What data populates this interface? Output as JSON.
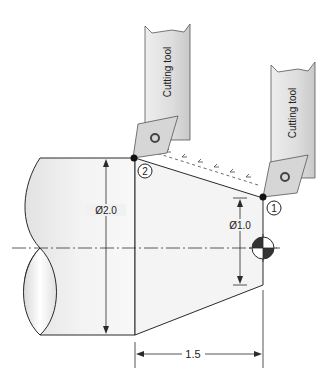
{
  "diagram": {
    "type": "turning-taper-toolpath",
    "tools": [
      {
        "id": "tool-2",
        "label": "Cutting tool"
      },
      {
        "id": "tool-1",
        "label": "Cutting tool"
      }
    ],
    "points": [
      {
        "id": "1",
        "label": "1"
      },
      {
        "id": "2",
        "label": "2"
      }
    ],
    "dimensions": {
      "large_diameter": "Ø2.0",
      "small_diameter": "Ø1.0",
      "taper_length": "1.5"
    },
    "colors": {
      "line": "#2a2a2a",
      "workpiece_fill": "#f1f1f1",
      "tool_fill": "#dcdcdc",
      "insert_fill": "#d4d4d4"
    }
  }
}
